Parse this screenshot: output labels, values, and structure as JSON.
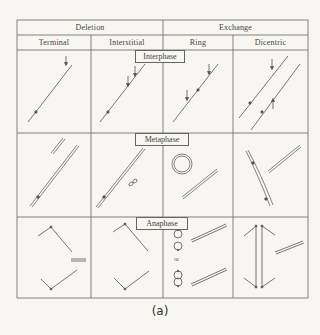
{
  "table": {
    "group_headers": [
      {
        "label": "Deletion",
        "span": [
          "Terminal",
          "Interstitial"
        ]
      },
      {
        "label": "Exchange",
        "span": [
          "Ring",
          "Dicentric"
        ]
      }
    ],
    "column_headers": [
      "Terminal",
      "Interstitial",
      "Ring",
      "Dicentric"
    ],
    "rows": [
      {
        "phase": "Interphase"
      },
      {
        "phase": "Metaphase"
      },
      {
        "phase": "Anaphase"
      }
    ]
  },
  "annotations": {
    "or_label": "or"
  },
  "caption": "(a)",
  "colors": {
    "line": "#555555",
    "background": "#f7f6f2"
  }
}
